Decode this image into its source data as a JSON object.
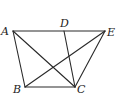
{
  "diagram": {
    "type": "geometry",
    "points": [
      {
        "name": "A",
        "x": 13,
        "y": 31,
        "label_x": 1,
        "label_y": 35
      },
      {
        "name": "D",
        "x": 64,
        "y": 31,
        "label_x": 60,
        "label_y": 27
      },
      {
        "name": "E",
        "x": 105,
        "y": 31,
        "label_x": 107,
        "label_y": 36
      },
      {
        "name": "B",
        "x": 25,
        "y": 87,
        "label_x": 13,
        "label_y": 93
      },
      {
        "name": "C",
        "x": 75,
        "y": 87,
        "label_x": 77,
        "label_y": 93
      }
    ],
    "segments": [
      [
        "A",
        "E"
      ],
      [
        "A",
        "B"
      ],
      [
        "B",
        "C"
      ],
      [
        "A",
        "C"
      ],
      [
        "B",
        "E"
      ],
      [
        "D",
        "C"
      ],
      [
        "C",
        "E"
      ]
    ],
    "labels": {
      "A": "A",
      "B": "B",
      "C": "C",
      "D": "D",
      "E": "E"
    }
  }
}
